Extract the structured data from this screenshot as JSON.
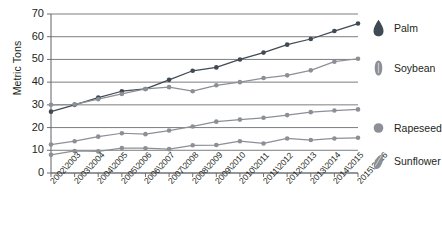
{
  "chart_data": {
    "type": "line",
    "title": "",
    "xlabel": "",
    "ylabel": "Metric Tons",
    "ylim": [
      0,
      70
    ],
    "ytick_values": [
      0,
      10,
      20,
      30,
      40,
      50,
      60,
      70
    ],
    "ytick_labels": [
      "0",
      "10",
      "20",
      "30",
      "40",
      "50",
      "60",
      "70"
    ],
    "grid": true,
    "grid_axis": "y",
    "legend_position": "right",
    "categories": [
      "2002\\2003",
      "2003\\2004",
      "2004\\2005",
      "2005\\2006",
      "2006\\2007",
      "2007\\2008",
      "2008\\2009",
      "2009\\2010",
      "2010\\2011",
      "2011\\2012",
      "2012\\2013",
      "2013\\2014",
      "2014\\2015",
      "2015\\2016"
    ],
    "series": [
      {
        "name": "Palm",
        "color": "#3f4a54",
        "marker": "circle",
        "values": [
          27.0,
          30.0,
          33.2,
          36.0,
          37.0,
          41.0,
          45.0,
          46.5,
          50.0,
          53.0,
          56.5,
          59.0,
          62.5,
          65.8
        ]
      },
      {
        "name": "Soybean",
        "color": "#8c9096",
        "marker": "circle",
        "values": [
          30.0,
          30.2,
          32.5,
          34.8,
          37.0,
          37.8,
          36.0,
          38.6,
          40.0,
          41.8,
          43.0,
          45.2,
          49.0,
          50.3
        ]
      },
      {
        "name": "Rapeseed",
        "color": "#8c9096",
        "marker": "circle",
        "values": [
          12.5,
          14.0,
          16.0,
          17.5,
          17.1,
          18.7,
          20.5,
          22.6,
          23.5,
          24.3,
          25.5,
          26.8,
          27.5,
          28.0
        ]
      },
      {
        "name": "Sunflower",
        "color": "#8c9096",
        "marker": "circle",
        "values": [
          8.0,
          9.7,
          9.5,
          11.0,
          10.9,
          10.5,
          12.2,
          12.3,
          14.0,
          13.0,
          15.2,
          14.5,
          15.2,
          15.5
        ]
      }
    ]
  },
  "legend": {
    "items": [
      {
        "label": "Palm",
        "glyph": "palm-droplet-icon",
        "color": "#3f4a54"
      },
      {
        "label": "Soybean",
        "glyph": "soybean-oval-icon",
        "color": "#8c9096"
      },
      {
        "label": "Rapeseed",
        "glyph": "rapeseed-circle-icon",
        "color": "#8c9096"
      },
      {
        "label": "Sunflower",
        "glyph": "sunflower-seed-icon",
        "color": "#8c9096"
      }
    ]
  },
  "axis": {
    "y_title": "Metric Tons"
  },
  "colors": {
    "palm": "#3f4a54",
    "gray_series": "#8c9096",
    "gridline": "#6d6f72",
    "axis": "#6d6f72",
    "text": "#231f20",
    "background": "#ffffff"
  }
}
